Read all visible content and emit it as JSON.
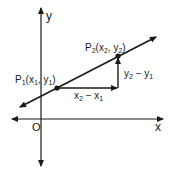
{
  "diagram": {
    "axes": {
      "x_label": "x",
      "y_label": "y",
      "origin_label": "O"
    },
    "points": [
      {
        "name": "P",
        "sub": "1",
        "coords_text_open": "(x",
        "xsub": "1",
        "sep": ", y",
        "ysub": "1",
        "close": ")"
      },
      {
        "name": "P",
        "sub": "2",
        "coords_text_open": "(x",
        "xsub": "2",
        "sep": ", y",
        "ysub": "2",
        "close": ")"
      }
    ],
    "run_label": {
      "a": "x",
      "asub": "2",
      "op": " − x",
      "bsub": "1"
    },
    "rise_label": {
      "a": "y",
      "asub": "2",
      "op": " − y",
      "bsub": "1"
    },
    "colors": {
      "ink": "#1a1a1a",
      "background": "#ffffff"
    }
  }
}
